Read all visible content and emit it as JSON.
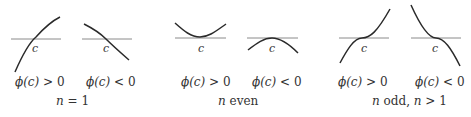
{
  "panels": [
    {
      "caption": "n = 1",
      "caption_var": "n",
      "caption_rest": " = 1",
      "plots": [
        {
          "point_label": "c",
          "condition_var": "ϕ(c)",
          "condition_op": " > 0"
        },
        {
          "point_label": "c",
          "condition_var": "ϕ(c)",
          "condition_op": " < 0"
        }
      ]
    },
    {
      "caption": "n even",
      "caption_var": "n",
      "caption_rest": " even",
      "plots": [
        {
          "point_label": "c",
          "condition_var": "ϕ(c)",
          "condition_op": " > 0"
        },
        {
          "point_label": "c",
          "condition_var": "ϕ(c)",
          "condition_op": " < 0"
        }
      ]
    },
    {
      "caption": "n odd, n > 1",
      "caption_var": "n",
      "caption_rest": " odd, ",
      "caption_var2": "n",
      "caption_rest2": " > 1",
      "plots": [
        {
          "point_label": "c",
          "condition_var": "ϕ(c)",
          "condition_op": " > 0"
        },
        {
          "point_label": "c",
          "condition_var": "ϕ(c)",
          "condition_op": " < 0"
        }
      ]
    }
  ]
}
